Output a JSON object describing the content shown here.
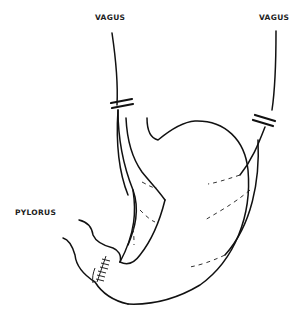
{
  "diagram": {
    "labels": {
      "vagus_left": "VAGUS",
      "vagus_right": "VAGUS",
      "pylorus": "PYLORUS"
    },
    "colors": {
      "line": "#111111",
      "background": "#ffffff"
    }
  }
}
